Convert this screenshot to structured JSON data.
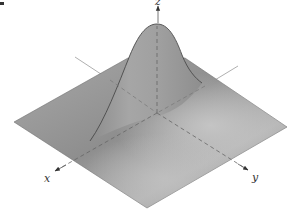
{
  "figure": {
    "surface_color": "#9a9a9a",
    "axis_color": "#555555",
    "axes": [
      {
        "name": "x",
        "label": "x"
      },
      {
        "name": "y",
        "label": "y"
      },
      {
        "name": "z",
        "label": "z"
      }
    ]
  }
}
